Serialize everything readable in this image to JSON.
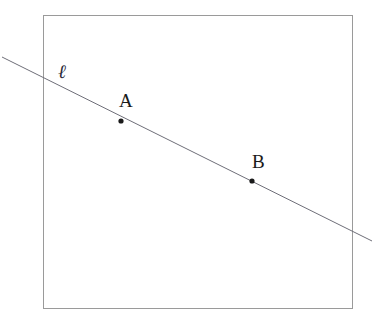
{
  "figure": {
    "type": "geometry-diagram",
    "background_color": "#ffffff",
    "width": 380,
    "height": 322
  },
  "frame": {
    "name": "bounding-rectangle",
    "x": 43,
    "y": 15,
    "width": 309,
    "height": 293,
    "stroke_color": "#9a9a9a",
    "stroke_width": 1,
    "fill": "none"
  },
  "line": {
    "name": "line-ell",
    "label": "ℓ",
    "label_x": 58,
    "label_y": 62,
    "x1": 2,
    "y1": 57,
    "x2": 372,
    "y2": 241,
    "stroke_color": "#6e6e78",
    "stroke_width": 1,
    "slope": 0.497
  },
  "points": [
    {
      "name": "point-a",
      "label": "A",
      "cx": 121,
      "cy": 121,
      "radius": 2.6,
      "color": "#1a1a1a",
      "label_x": 119,
      "label_y": 91
    },
    {
      "name": "point-b",
      "label": "B",
      "cx": 252,
      "cy": 181,
      "radius": 2.6,
      "color": "#1a1a1a",
      "label_x": 252,
      "label_y": 152
    }
  ],
  "chart_data": {
    "type": "scatter",
    "title": "",
    "xlabel": "",
    "ylabel": "",
    "grid": false,
    "legend": "none",
    "annotations": [
      "ℓ",
      "A",
      "B"
    ],
    "series": [
      {
        "name": "marked points",
        "points": [
          {
            "label": "A",
            "x": 121,
            "y": 121
          },
          {
            "label": "B",
            "x": 252,
            "y": 181
          }
        ]
      },
      {
        "name": "line ℓ",
        "points": [
          {
            "label": "start",
            "x": 2,
            "y": 57
          },
          {
            "label": "end",
            "x": 372,
            "y": 241
          }
        ]
      }
    ]
  }
}
